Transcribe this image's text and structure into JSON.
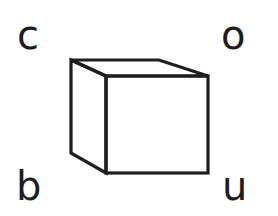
{
  "logo": {
    "letters": {
      "top_left": "c",
      "top_right": "o",
      "bottom_left": "b",
      "bottom_right": "u"
    },
    "shape": "cube-icon",
    "colors": {
      "stroke": "#1e1e1e",
      "background": "#ffffff"
    }
  }
}
